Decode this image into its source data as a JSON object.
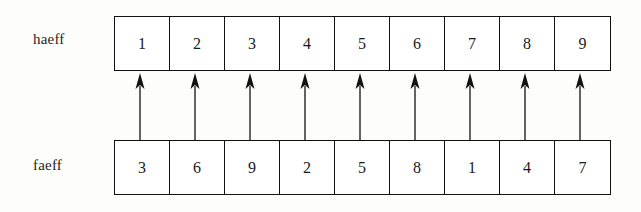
{
  "diagram": {
    "type": "array-mapping-diagram",
    "rows": [
      {
        "name": "haeff-row",
        "label": "haeff",
        "cells": [
          "1",
          "2",
          "3",
          "4",
          "5",
          "6",
          "7",
          "8",
          "9"
        ]
      },
      {
        "name": "faeff-row",
        "label": "faeff",
        "cells": [
          "3",
          "6",
          "9",
          "2",
          "5",
          "8",
          "1",
          "4",
          "7"
        ]
      }
    ],
    "arrows": {
      "count": 9,
      "direction": "up",
      "icon": "arrow-up-icon",
      "from_row": "faeff",
      "to_row": "haeff"
    },
    "colors": {
      "ink": "#111111",
      "text": "#1a1a1a",
      "cell_fill": "#ffffff",
      "page_background": "#fdfdfb"
    }
  }
}
